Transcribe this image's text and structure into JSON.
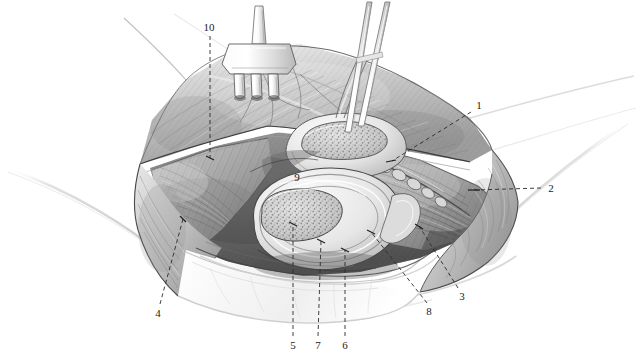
{
  "figure": {
    "background_color": "#ffffff",
    "ink_color": "#1c1c1c",
    "width": 636,
    "height": 360,
    "style": "grayscale pencil/stipple medical illustration"
  },
  "instruments": [
    {
      "name": "three-prong rake retractor",
      "position": "upper left-of-center",
      "prongs": 3
    },
    {
      "name": "forceps",
      "position": "upper right-of-center",
      "jaws": 2
    }
  ],
  "structures": [
    {
      "name": "cut spermatic cord cross-section",
      "appearance": "speckled oval",
      "position": "upper center"
    },
    {
      "name": "testis cross-section",
      "appearance": "speckled oval in tunica layers",
      "position": "center"
    },
    {
      "name": "reflected skin and fascia flaps",
      "position": "surrounding the exposure"
    },
    {
      "name": "oblique muscle fibers",
      "position": "right of exposure"
    }
  ],
  "callouts": [
    {
      "id": "1",
      "label": "1",
      "x": 479,
      "y": 105,
      "leader_to_x": 390,
      "leader_to_y": 160,
      "leader": "dashed"
    },
    {
      "id": "2",
      "label": "2",
      "x": 551,
      "y": 188,
      "leader_to_x": 473,
      "leader_to_y": 190,
      "leader": "dashed"
    },
    {
      "id": "3",
      "label": "3",
      "x": 462,
      "y": 296,
      "leader_to_x": 418,
      "leader_to_y": 226,
      "leader": "dashed"
    },
    {
      "id": "4",
      "label": "4",
      "x": 158,
      "y": 313,
      "leader_to_x": 183,
      "leader_to_y": 220,
      "leader": "dashed"
    },
    {
      "id": "5",
      "label": "5",
      "x": 293,
      "y": 345,
      "leader_to_x": 293,
      "leader_to_y": 225,
      "leader": "dashed"
    },
    {
      "id": "6",
      "label": "6",
      "x": 345,
      "y": 345,
      "leader_to_x": 345,
      "leader_to_y": 249,
      "leader": "dashed"
    },
    {
      "id": "7",
      "label": "7",
      "x": 318,
      "y": 345,
      "leader_to_x": 320,
      "leader_to_y": 241,
      "leader": "dashed"
    },
    {
      "id": "8",
      "label": "8",
      "x": 429,
      "y": 311,
      "leader_to_x": 370,
      "leader_to_y": 232,
      "leader": "dashed"
    },
    {
      "id": "9",
      "label": "9",
      "x": 297,
      "y": 177,
      "leader_to_x": 297,
      "leader_to_y": 177,
      "leader": "none"
    },
    {
      "id": "10",
      "label": "10",
      "x": 209,
      "y": 27,
      "leader_to_x": 210,
      "leader_to_y": 158,
      "leader": "dashed"
    }
  ]
}
